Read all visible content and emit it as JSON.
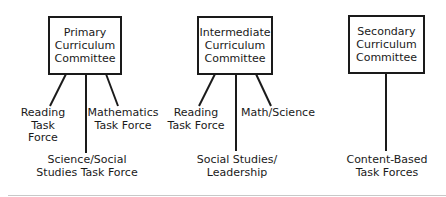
{
  "committees": [
    {
      "name_lines": [
        "Primary",
        "Curriculum",
        "Committee"
      ],
      "task_forces": [
        {
          "lines": [
            "Reading",
            "Task",
            "Force"
          ]
        },
        {
          "lines": [
            "Science/Social",
            "Studies Task Force"
          ]
        },
        {
          "lines": [
            "Mathematics",
            "Task Force"
          ]
        }
      ]
    },
    {
      "name_lines": [
        "Intermediate",
        "Curriculum",
        "Committee"
      ],
      "task_forces": [
        {
          "lines": [
            "Reading",
            "Task Force"
          ]
        },
        {
          "lines": [
            "Social Studies/",
            "Leadership"
          ]
        },
        {
          "lines": [
            "Math/Science"
          ]
        }
      ]
    },
    {
      "name_lines": [
        "Secondary",
        "Curriculum",
        "Committee"
      ],
      "task_forces": [
        {
          "lines": [
            "Content-Based",
            "Task Forces"
          ]
        }
      ]
    }
  ],
  "colors": {
    "line": "#1a1a1a",
    "background": "#ffffff",
    "rule": "#c8c8c8"
  }
}
